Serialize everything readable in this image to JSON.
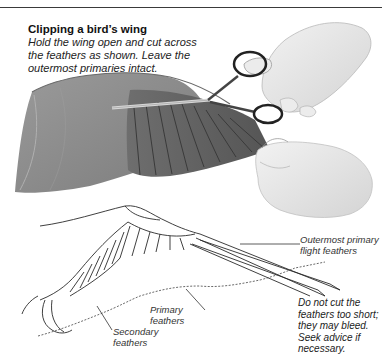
{
  "header": {
    "title": "Clipping a bird’s wing",
    "instructions": "Hold the wing open and cut across the feathers as shown. Leave the outermost primaries intact."
  },
  "illustration": {
    "top": "Hands holding a spread bird wing, cutting feathers with scissors",
    "bottom": "Line diagram of a bird wing showing cut line"
  },
  "labels": {
    "outermost": "Outermost primary flight feathers",
    "primary": "Primary feathers",
    "secondary": "Secondary feathers"
  },
  "note": "Do not cut the feathers too short; they may bleed. Seek advice if necessary.",
  "colors": {
    "wing_gray": "#8a8a8a",
    "wing_dark": "#5a5a5a",
    "hand": "#e6e6e6",
    "line": "#2a2a2a"
  }
}
